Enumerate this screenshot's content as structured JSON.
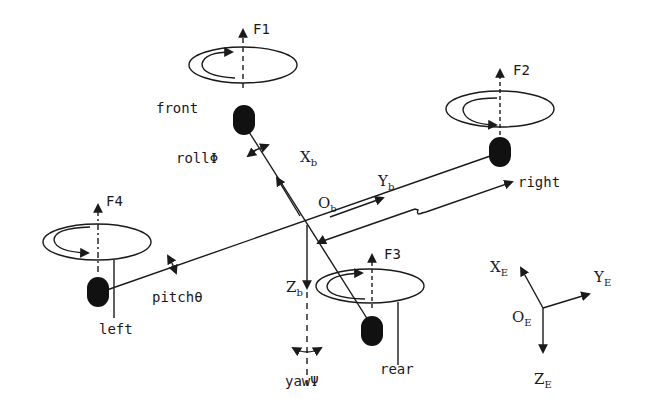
{
  "rotors": [
    {
      "id": "front",
      "label": "front",
      "force": "F1"
    },
    {
      "id": "right",
      "label": "right",
      "force": "F2"
    },
    {
      "id": "rear",
      "label": "rear",
      "force": "F3"
    },
    {
      "id": "left",
      "label": "left",
      "force": "F4"
    }
  ],
  "body_frame": {
    "origin": {
      "main": "O",
      "sub": "b"
    },
    "x": {
      "main": "X",
      "sub": "b"
    },
    "y": {
      "main": "Y",
      "sub": "b"
    },
    "z": {
      "main": "Z",
      "sub": "b"
    }
  },
  "earth_frame": {
    "origin": {
      "main": "O",
      "sub": "E"
    },
    "x": {
      "main": "X",
      "sub": "E"
    },
    "y": {
      "main": "Y",
      "sub": "E"
    },
    "z": {
      "main": "Z",
      "sub": "E"
    }
  },
  "angles": {
    "roll": "rollΦ",
    "pitch": "pitchθ",
    "yaw": "yawΨ"
  },
  "arm_length": "L",
  "colors": {
    "line": "#1a1a1a",
    "motor": "#111111",
    "background": "#ffffff"
  }
}
